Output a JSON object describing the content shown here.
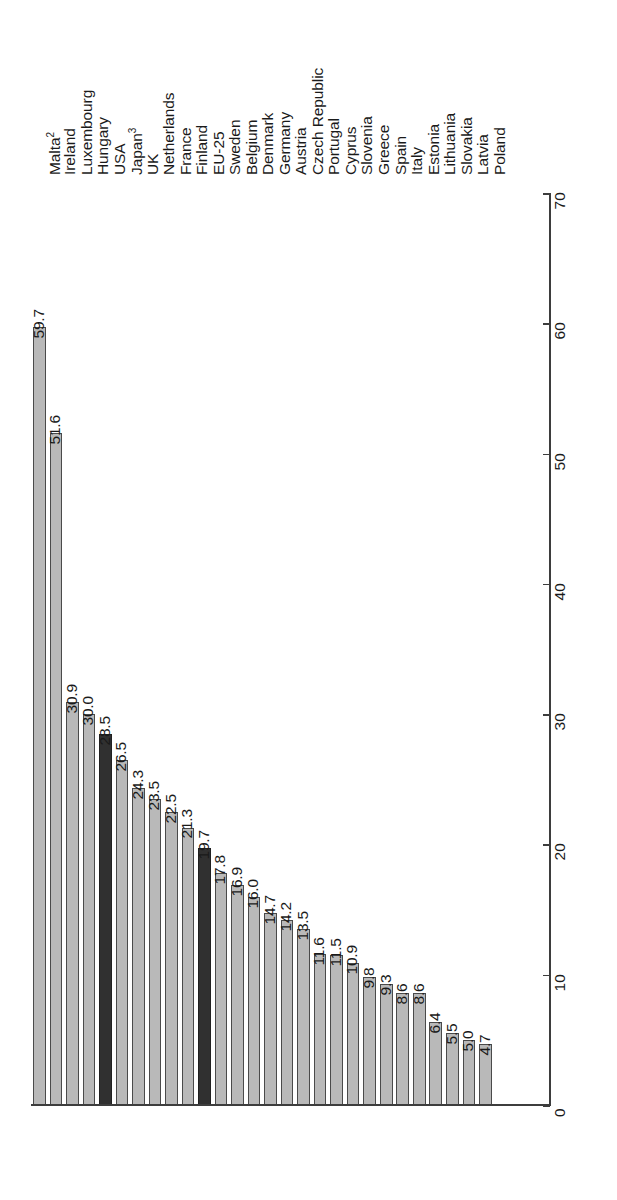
{
  "chart_data": {
    "type": "bar",
    "orientation": "vertical-bars-rotated",
    "title": "",
    "subtitle": "",
    "xlabel": "",
    "ylabel": "",
    "ylim": [
      0,
      70
    ],
    "grid": false,
    "legend": null,
    "tick_labels": [
      "0",
      "10",
      "20",
      "30",
      "40",
      "50",
      "60",
      "70"
    ],
    "ticks": [
      0,
      10,
      20,
      30,
      40,
      50,
      60,
      70
    ],
    "categories": [
      "Malta",
      "Ireland",
      "Luxembourg",
      "Hungary",
      "USA",
      "Japan",
      "UK",
      "Netherlands",
      "France",
      "Finland",
      "EU-25",
      "Sweden",
      "Belgium",
      "Denmark",
      "Germany",
      "Austria",
      "Czech Republic",
      "Portugal",
      "Cyprus",
      "Slovenia",
      "Greece",
      "Spain",
      "Italy",
      "Estonia",
      "Lithuania",
      "Slovakia",
      "Latvia",
      "Poland"
    ],
    "category_labels": [
      "Malta²",
      "Ireland",
      "Luxembourg",
      "Hungary",
      "USA",
      "Japan³",
      "UK",
      "Netherlands",
      "France",
      "Finland",
      "EU-25",
      "Sweden",
      "Belgium",
      "Denmark",
      "Germany",
      "Austria",
      "Czech Republic",
      "Portugal",
      "Cyprus",
      "Slovenia",
      "Greece",
      "Spain",
      "Italy",
      "Estonia",
      "Lithuania",
      "Slovakia",
      "Latvia",
      "Poland"
    ],
    "footnote_markers": {
      "Malta": "2",
      "Japan": "3"
    },
    "values": [
      59.7,
      51.6,
      30.9,
      30.0,
      28.5,
      26.5,
      24.3,
      23.5,
      22.5,
      21.3,
      19.7,
      17.8,
      16.9,
      16.0,
      14.7,
      14.2,
      13.5,
      11.6,
      11.5,
      10.9,
      9.8,
      9.3,
      8.6,
      8.6,
      6.4,
      5.5,
      5.0,
      4.7
    ],
    "value_labels": [
      "59.7",
      "51.6",
      "30.9",
      "30.0",
      "28.5",
      "26.5",
      "24.3",
      "23.5",
      "22.5",
      "21.3",
      "19.7",
      "17.8",
      "16.9",
      "16.0",
      "14.7",
      "14.2",
      "13.5",
      "11.6",
      "11.5",
      "10.9",
      "9.8",
      "9.3",
      "8.6",
      "8.6",
      "6.4",
      "5.5",
      "5.0",
      "4.7"
    ],
    "highlighted": [
      false,
      false,
      false,
      false,
      true,
      false,
      false,
      false,
      false,
      false,
      true,
      false,
      false,
      false,
      false,
      false,
      false,
      false,
      false,
      false,
      false,
      false,
      false,
      false,
      false,
      false,
      false,
      false
    ],
    "colors": {
      "bar_fill": "#b9b9b9",
      "bar_stroke": "#4a4a4a",
      "bar_fill_highlight": "#303030",
      "bar_stroke_highlight": "#202020",
      "axis": "#3d3d3d",
      "text": "#1a1a1a",
      "background": "#ffffff"
    }
  }
}
